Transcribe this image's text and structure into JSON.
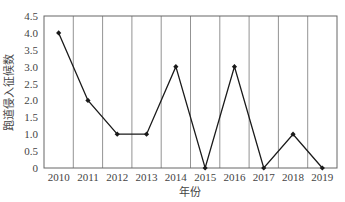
{
  "chart_data": {
    "type": "line",
    "title": "",
    "xlabel": "年份",
    "ylabel": "跑道侵入征候数",
    "categories": [
      "2010",
      "2011",
      "2012",
      "2013",
      "2014",
      "2015",
      "2016",
      "2017",
      "2018",
      "2019"
    ],
    "series": [
      {
        "name": "跑道侵入征候数",
        "values": [
          4,
          2,
          1,
          1,
          3,
          0,
          3,
          0,
          1,
          0
        ]
      }
    ],
    "ylim": [
      0,
      4.5
    ],
    "yticks": [
      "0",
      "0.5",
      "1.0",
      "1.5",
      "2.0",
      "2.5",
      "3.0",
      "3.5",
      "4.0",
      "4.5"
    ],
    "grid": {
      "vertical": true,
      "horizontal": false
    },
    "legend": "none",
    "marker": "diamond",
    "colors": {
      "line": "#1a1a1a",
      "grid": "#777777",
      "frame": "#666666"
    }
  }
}
